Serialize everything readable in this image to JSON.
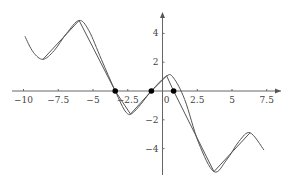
{
  "chart_data": {
    "type": "line",
    "title": "",
    "xlabel": "",
    "ylabel": "",
    "xlim": [
      -10.2,
      8.5
    ],
    "ylim": [
      -5.8,
      5.4
    ],
    "grid": false,
    "legend": null,
    "x_ticks": [
      -10,
      -7.5,
      -5,
      -2.5,
      0,
      2.5,
      5,
      7.5
    ],
    "x_tick_labels": [
      "−10",
      "−7.5",
      "−5",
      "−2.5",
      "0",
      "2.5",
      "5",
      "7.5"
    ],
    "y_ticks": [
      4,
      2,
      -2,
      -4
    ],
    "y_tick_labels": [
      "4",
      "2",
      "−2",
      "−4"
    ],
    "series": [
      {
        "name": "smooth curve",
        "style": "smooth",
        "points": [
          [
            -9.9,
            3.8
          ],
          [
            -9.3,
            2.7
          ],
          [
            -8.6,
            2.2
          ],
          [
            -7.8,
            2.8
          ],
          [
            -6.9,
            4.0
          ],
          [
            -6.0,
            4.9
          ],
          [
            -5.3,
            4.2
          ],
          [
            -4.4,
            2.2
          ],
          [
            -3.4,
            0.0
          ],
          [
            -2.6,
            -1.5
          ],
          [
            -2.0,
            -1.4
          ],
          [
            -0.8,
            0.0
          ],
          [
            0.3,
            1.05
          ],
          [
            0.8,
            0.9
          ],
          [
            1.6,
            -0.6
          ],
          [
            2.6,
            -3.6
          ],
          [
            3.7,
            -5.6
          ],
          [
            4.6,
            -4.8
          ],
          [
            5.5,
            -3.5
          ],
          [
            6.3,
            -2.9
          ],
          [
            7.3,
            -4.1
          ]
        ]
      },
      {
        "name": "interpolant",
        "style": "polyline",
        "points": [
          [
            -8.6,
            2.2
          ],
          [
            -6.0,
            4.9
          ],
          [
            -3.4,
            0.0
          ],
          [
            -2.3,
            -1.6
          ],
          [
            -0.8,
            0.0
          ],
          [
            0.3,
            1.05
          ],
          [
            0.8,
            0.0
          ],
          [
            3.7,
            -5.6
          ],
          [
            6.3,
            -2.9
          ]
        ]
      }
    ],
    "marked_points": [
      [
        -3.4,
        0
      ],
      [
        -0.8,
        0
      ],
      [
        0.8,
        0
      ]
    ]
  }
}
